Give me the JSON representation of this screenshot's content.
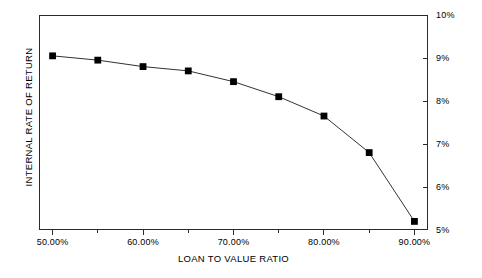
{
  "chart_data": {
    "type": "line",
    "title": "",
    "xlabel": "LOAN TO VALUE RATIO",
    "ylabel": "INTERNAL RATE OF RETURN",
    "x": [
      50,
      55,
      60,
      65,
      70,
      75,
      80,
      85,
      90
    ],
    "values": [
      9.05,
      8.95,
      8.8,
      8.7,
      8.45,
      8.1,
      7.65,
      6.8,
      5.2
    ],
    "xlim": [
      48.5,
      91.5
    ],
    "ylim": [
      5,
      10
    ],
    "x_tick_labels": [
      "50.00%",
      "60.00%",
      "70.00%",
      "80.00%",
      "90.00%"
    ],
    "x_tick_values": [
      50,
      60,
      70,
      80,
      90
    ],
    "x_minor_tick_values": [
      55,
      65,
      75,
      85
    ],
    "y_tick_labels": [
      "10%",
      "9%",
      "8%",
      "7%",
      "6%",
      "5%"
    ],
    "y_tick_values": [
      10,
      9,
      8,
      7,
      6,
      5
    ],
    "y_axis_position": "right",
    "grid": false,
    "legend": null,
    "marker": "square",
    "marker_color": "#000000",
    "line_color": "#333333",
    "background_color": "#ffffff",
    "frame_color": "#2b2b2b"
  },
  "axes": {
    "x_title": "LOAN TO VALUE RATIO",
    "y_title": "INTERNAL RATE OF RETURN"
  }
}
